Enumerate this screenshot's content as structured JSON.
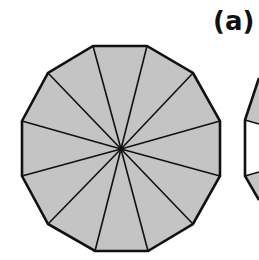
{
  "figure": {
    "label": "(a)",
    "main_shape": {
      "name": "regular dodecagon",
      "sides": 12,
      "triangles": 12,
      "center": [
        121,
        149
      ],
      "vertices": [
        [
          93,
          46
        ],
        [
          147,
          46
        ],
        [
          193,
          73
        ],
        [
          220,
          121
        ],
        [
          220,
          176
        ],
        [
          193,
          224
        ],
        [
          148,
          251
        ],
        [
          95,
          251
        ],
        [
          48,
          224
        ],
        [
          22,
          176
        ],
        [
          22,
          121
        ],
        [
          48,
          73
        ]
      ],
      "fill": "#c4c4c4",
      "stroke": "#111111"
    },
    "partial_shape": {
      "name": "second polygon (partially visible)",
      "vertices": [
        [
          259,
          78
        ],
        [
          245,
          120
        ],
        [
          245,
          176
        ],
        [
          259,
          200
        ]
      ],
      "top_fill": "#c4c4c4",
      "middle_fill": "#ffffff",
      "stroke": "#111111"
    }
  }
}
